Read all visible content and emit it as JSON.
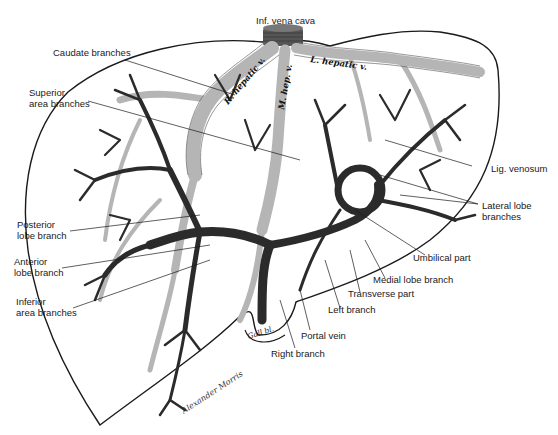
{
  "figure": {
    "colors": {
      "outline": "#1a1a1a",
      "portal_dark": "#2b2b2b",
      "hepatic_light": "#b5b5b5",
      "hepatic_stipple": "#8a8a8a",
      "background": "#ffffff"
    },
    "vessel_labels": {
      "right_hepatic": "R. hepatic v.",
      "middle_hepatic": "M. hep. v.",
      "left_hepatic": "L. hepatic v."
    },
    "labels": {
      "inf_vena_cava": "Inf. vena cava",
      "caudate_branches": "Caudate branches",
      "superior_area_branches_1": "Superior",
      "superior_area_branches_2": "area branches",
      "lig_venosum": "Lig. venosum",
      "lateral_lobe_branches_1": "Lateral lobe",
      "lateral_lobe_branches_2": "branches",
      "posterior_lobe_branch_1": "Posterior",
      "posterior_lobe_branch_2": "lobe branch",
      "anterior_lobe_branch_1": "Anterior",
      "anterior_lobe_branch_2": "lobe branch",
      "inferior_area_branches_1": "Inferior",
      "inferior_area_branches_2": "area branches",
      "umbilical_part": "Umbilical part",
      "medial_lobe_branch": "Medial lobe branch",
      "transverse_part": "Transverse part",
      "left_branch": "Left branch",
      "portal_vein": "Portal vein",
      "right_branch": "Right branch",
      "gall_bladder": "Gall bl."
    },
    "signature": "Alexander Morris"
  }
}
